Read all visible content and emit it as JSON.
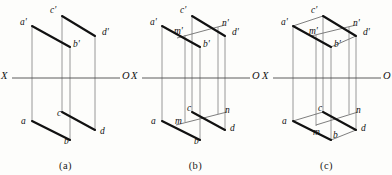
{
  "figure": {
    "background": "#fdfdfb",
    "line_color": "#1a1a1a",
    "thin_line_color": "#8c8c8c",
    "width": 392,
    "height": 175
  },
  "panels": [
    {
      "id": "a",
      "caption": "(a)",
      "axis": {
        "left_label": "X",
        "right_label": "O"
      },
      "labels": [
        {
          "name": "a-prime",
          "text": "a'",
          "x": 20,
          "y": 18
        },
        {
          "name": "c-prime",
          "text": "c'",
          "x": 50,
          "y": 6
        },
        {
          "name": "b-prime",
          "text": "b'",
          "x": 73,
          "y": 40
        },
        {
          "name": "d-prime",
          "text": "d'",
          "x": 102,
          "y": 28
        },
        {
          "name": "a",
          "text": "a",
          "x": 21,
          "y": 117
        },
        {
          "name": "c",
          "text": "c",
          "x": 57,
          "y": 109
        },
        {
          "name": "b",
          "text": "b",
          "x": 64,
          "y": 137
        },
        {
          "name": "d",
          "text": "d",
          "x": 100,
          "y": 127
        }
      ]
    },
    {
      "id": "b",
      "caption": "(b)",
      "axis": {
        "left_label": "X",
        "right_label": "O"
      },
      "labels": [
        {
          "name": "a-prime",
          "text": "a'",
          "x": 20,
          "y": 18
        },
        {
          "name": "c-prime",
          "text": "c'",
          "x": 50,
          "y": 6
        },
        {
          "name": "m-prime",
          "text": "m'",
          "x": 44,
          "y": 27
        },
        {
          "name": "n-prime",
          "text": "n'",
          "x": 92,
          "y": 19
        },
        {
          "name": "b-prime",
          "text": "b'",
          "x": 73,
          "y": 40
        },
        {
          "name": "d-prime",
          "text": "d'",
          "x": 102,
          "y": 28
        },
        {
          "name": "a",
          "text": "a",
          "x": 21,
          "y": 117
        },
        {
          "name": "c",
          "text": "c",
          "x": 57,
          "y": 104
        },
        {
          "name": "m",
          "text": "m",
          "x": 45,
          "y": 117
        },
        {
          "name": "n",
          "text": "n",
          "x": 95,
          "y": 106
        },
        {
          "name": "b",
          "text": "b",
          "x": 64,
          "y": 137
        },
        {
          "name": "d",
          "text": "d",
          "x": 100,
          "y": 124
        }
      ]
    },
    {
      "id": "c",
      "caption": "(c)",
      "axis": {
        "left_label": "X",
        "right_label": "O"
      },
      "labels": [
        {
          "name": "a-prime",
          "text": "a'",
          "x": 20,
          "y": 18
        },
        {
          "name": "c-prime",
          "text": "c'",
          "x": 50,
          "y": 6
        },
        {
          "name": "m-prime",
          "text": "m'",
          "x": 48,
          "y": 27
        },
        {
          "name": "n-prime",
          "text": "n'",
          "x": 92,
          "y": 19
        },
        {
          "name": "b-prime",
          "text": "b'",
          "x": 73,
          "y": 40
        },
        {
          "name": "d-prime",
          "text": "d'",
          "x": 102,
          "y": 28
        },
        {
          "name": "a",
          "text": "a",
          "x": 21,
          "y": 117
        },
        {
          "name": "c",
          "text": "c",
          "x": 57,
          "y": 104
        },
        {
          "name": "m",
          "text": "m",
          "x": 52,
          "y": 128
        },
        {
          "name": "n",
          "text": "n",
          "x": 95,
          "y": 106
        },
        {
          "name": "b",
          "text": "b",
          "x": 72,
          "y": 131
        },
        {
          "name": "d",
          "text": "d",
          "x": 100,
          "y": 124
        }
      ]
    }
  ],
  "geometry": {
    "note": "Panel-local coordinates, origin at panel top-left, 131x152 drawing area.",
    "axis_y": 78,
    "axis_x1": 12,
    "axis_x2": 120,
    "points": {
      "a_prime": {
        "x": 32,
        "y": 26
      },
      "c_prime": {
        "x": 62,
        "y": 16
      },
      "b_prime": {
        "x": 70,
        "y": 47
      },
      "d_prime": {
        "x": 95,
        "y": 36
      },
      "m_prime": {
        "x": 55,
        "y": 35
      },
      "n_prime": {
        "x": 88,
        "y": 27
      },
      "a": {
        "x": 32,
        "y": 121
      },
      "c": {
        "x": 62,
        "y": 112
      },
      "b": {
        "x": 70,
        "y": 140
      },
      "d": {
        "x": 95,
        "y": 130
      },
      "m": {
        "x": 55,
        "y": 122
      },
      "n": {
        "x": 88,
        "y": 114
      }
    },
    "verticals": {
      "a_x": 32,
      "c_x": 62,
      "b_x": 70,
      "d_x": 95,
      "m_x": 55,
      "n_x": 88,
      "top": 16,
      "bottom": 142
    }
  }
}
